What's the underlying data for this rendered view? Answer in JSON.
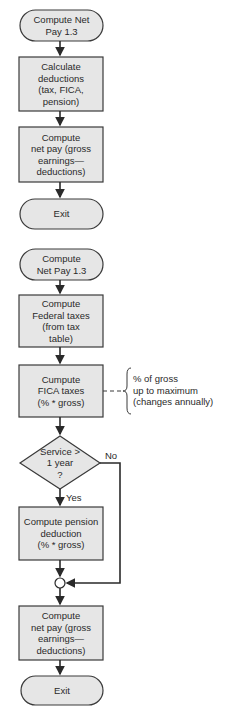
{
  "colors": {
    "fill": "#e6e6e6",
    "stroke": "#3a3a3a",
    "background": "#ffffff"
  },
  "flowchart_summary": {
    "start": {
      "text": "Compute Net\nPay 1.3"
    },
    "steps": [
      {
        "text": "Calculate\ndeductions\n(tax, FICA,\npension)"
      },
      {
        "text": "Compute\nnet pay (gross\nearnings—\ndeductions)"
      }
    ],
    "end": {
      "text": "Exit"
    }
  },
  "flowchart_detail": {
    "start": {
      "text": "Compute\nNet Pay 1.3"
    },
    "federal": {
      "text": "Compute\nFederal taxes\n(from tax\ntable)"
    },
    "fica": {
      "text": "Cumpute\nFICA taxes\n(% * gross)"
    },
    "fica_note": {
      "text": "% of gross\nup to maximum\n(changes annually)"
    },
    "decision": {
      "text": "Service >\n1 year\n?",
      "yes_label": "Yes",
      "no_label": "No"
    },
    "pension": {
      "text": "Compute pension\ndeduction\n(% * gross)"
    },
    "netpay": {
      "text": "Compute\nnet pay (gross\nearnings—\ndeductions)"
    },
    "end": {
      "text": "Exit"
    }
  }
}
